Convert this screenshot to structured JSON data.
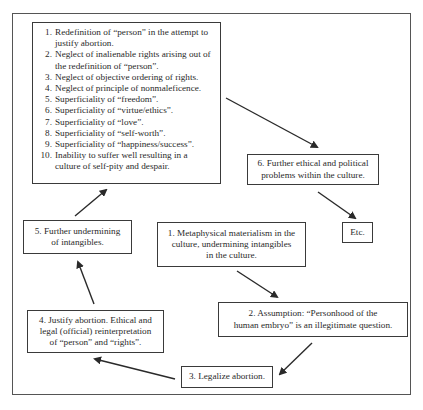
{
  "diagram": {
    "type": "flow-cycle",
    "nodes": {
      "consequences": {
        "items": [
          {
            "num": "1.",
            "text": "Redefinition of “person” in the attempt to justify abortion."
          },
          {
            "num": "2.",
            "text": "Neglect of inalienable rights arising out of the redefinition of “person”."
          },
          {
            "num": "3.",
            "text": "Neglect of objective ordering of rights."
          },
          {
            "num": "4.",
            "text": "Neglect of principle of nonmaleficence."
          },
          {
            "num": "5.",
            "text": "Superficiality of “freedom”."
          },
          {
            "num": "6.",
            "text": "Superficiality of “virtue/ethics”."
          },
          {
            "num": "7.",
            "text": "Superficiality of “love”."
          },
          {
            "num": "8.",
            "text": "Superficiality of “self-worth”."
          },
          {
            "num": "9.",
            "text": "Superficiality of “happiness/success”."
          },
          {
            "num": "10.",
            "text": "Inability to suffer well resulting in a culture of self-pity and despair."
          }
        ]
      },
      "step1": {
        "line1": "1. Metaphysical materialism in the",
        "line2": "culture, undermining intangibles",
        "line3": "in the culture."
      },
      "step2": {
        "line1": "2. Assumption: “Personhood of the",
        "line2": "human embryo” is an illegitimate question."
      },
      "step3": {
        "line1": "3. Legalize abortion."
      },
      "step4": {
        "line1": "4. Justify abortion. Ethical and",
        "line2": "legal (official) reinterpretation",
        "line3": "of “person” and “rights”."
      },
      "step5": {
        "line1": "5. Further undermining",
        "line2": "of intangibles."
      },
      "step6": {
        "line1": "6. Further ethical and political",
        "line2": "problems within the culture."
      },
      "etc": {
        "line1": "Etc."
      }
    },
    "edges": [
      {
        "from": "step1",
        "to": "step2"
      },
      {
        "from": "step2",
        "to": "step3"
      },
      {
        "from": "step3",
        "to": "step4"
      },
      {
        "from": "step4",
        "to": "step5"
      },
      {
        "from": "step5",
        "to": "consequences"
      },
      {
        "from": "consequences",
        "to": "step6"
      },
      {
        "from": "step6",
        "to": "etc"
      }
    ],
    "colors": {
      "line": "#2a2a2a",
      "border": "#3a3a3a",
      "frame": "#555555",
      "background": "#ffffff"
    }
  }
}
